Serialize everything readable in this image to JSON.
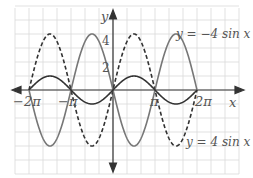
{
  "chart_data": {
    "type": "line",
    "title": "",
    "xlabel": "x",
    "ylabel": "y",
    "xlim": [
      -6.9,
      8.4
    ],
    "ylim": [
      -5.7,
      5.7
    ],
    "grid": true,
    "x_ticks": [
      {
        "value": -6.2832,
        "label": "−2π"
      },
      {
        "value": -3.1416,
        "label": "−π"
      },
      {
        "value": 3.1416,
        "label": "π"
      },
      {
        "value": 6.2832,
        "label": "2π"
      }
    ],
    "y_ticks": [
      {
        "value": 2,
        "label": "2"
      },
      {
        "value": 4,
        "label": "4"
      }
    ],
    "series": [
      {
        "name": "y = 4 sin x",
        "function": "4*sin(x)",
        "style": "dashed",
        "color": "#333333",
        "domain": [
          -6.2832,
          6.2832
        ]
      },
      {
        "name": "y = −4 sin x",
        "function": "-4*sin(x)",
        "style": "solid",
        "color": "#777777",
        "domain": [
          -6.2832,
          6.2832
        ]
      },
      {
        "name": "y = sin x",
        "function": "sin(x)",
        "style": "solid",
        "color": "#333333",
        "domain": [
          -6.2832,
          6.2832
        ]
      }
    ],
    "annotations": [
      {
        "text": "y = −4 sin x",
        "near": "top-right"
      },
      {
        "text": "y = 4 sin x",
        "near": "bottom-right"
      }
    ]
  },
  "labels": {
    "x_axis": "x",
    "y_axis": "y",
    "tick_neg_2pi": "−2π",
    "tick_neg_pi": "−π",
    "tick_pi": "π",
    "tick_2pi": "2π",
    "tick_y2": "2",
    "tick_y4": "4",
    "label_neg4sin": "y = −4 sin x",
    "label_4sin": "y = 4 sin x"
  }
}
